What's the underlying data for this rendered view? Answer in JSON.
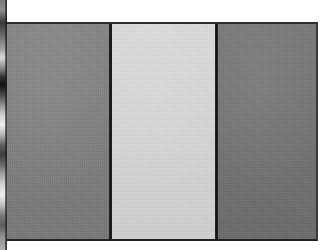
{
  "image": {
    "subject": "flag",
    "description": "Grayscale photograph of a vertical triband flag",
    "orientation": "horizontal",
    "background_color": "#ffffff",
    "frame": {
      "left": 7,
      "top": 22,
      "width": 311,
      "height": 219,
      "border_color": "#2b2b2b"
    },
    "bands": [
      {
        "name": "hoist-band",
        "position": "left",
        "color": "#7d7d7d",
        "width_px": 102,
        "tone": "medium gray"
      },
      {
        "name": "middle-band",
        "position": "center",
        "color": "#dcdcdc",
        "width_px": 103,
        "tone": "very light gray"
      },
      {
        "name": "fly-band",
        "position": "right",
        "color": "#6f6f6f",
        "width_px": 101,
        "tone": "dark medium gray"
      }
    ],
    "dividers": [
      {
        "name": "divider-left",
        "color": "#141414",
        "x_px": 109
      },
      {
        "name": "divider-right",
        "color": "#141414",
        "x_px": 214
      }
    ],
    "left_edge_object": {
      "name": "left-edge-strip",
      "width_px": 7,
      "description": "narrow partial edge of adjacent object with light and dark gradient bands",
      "colors": [
        "#121212",
        "#5a5a5a",
        "#8f8f8f",
        "#d8d8d8",
        "#efefef"
      ]
    },
    "texture": "woven fabric"
  }
}
